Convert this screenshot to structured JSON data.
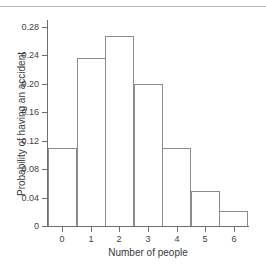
{
  "chart_data": {
    "type": "bar",
    "title": "",
    "xlabel": "Number of people",
    "ylabel": "Probability of having an accident",
    "categories": [
      "0",
      "1",
      "2",
      "3",
      "4",
      "5",
      "6"
    ],
    "values": [
      0.11,
      0.236,
      0.267,
      0.2,
      0.11,
      0.049,
      0.021
    ],
    "xlim": [
      -0.5,
      6.5
    ],
    "ylim": [
      0,
      0.29
    ],
    "ytick_labels": [
      "0",
      "0.04",
      "0.08",
      "0.12",
      "0.16",
      "0.20",
      "0.24",
      "0.28"
    ],
    "ytick_values": [
      0,
      0.04,
      0.08,
      0.12,
      0.16,
      0.2,
      0.24,
      0.28
    ],
    "xtick_labels": [
      "0",
      "1",
      "2",
      "3",
      "4",
      "5",
      "6"
    ],
    "grid": false,
    "legend": false,
    "bar_edge_color": "#8c8c8c",
    "bar_fill_color": "#ffffff",
    "axis_color": "#6e6e6e",
    "text_color": "#3a3a3a"
  }
}
